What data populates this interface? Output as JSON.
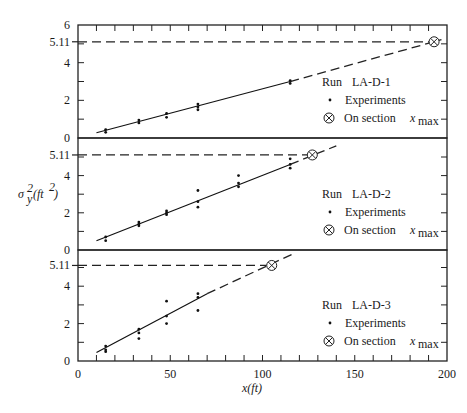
{
  "chart_data": {
    "type": "scatter",
    "title": "",
    "xlabel": "x(ft)",
    "ylabel": "σy²(ft²)",
    "xlim": [
      0,
      200
    ],
    "x_ticks": [
      0,
      50,
      100,
      150,
      200
    ],
    "x_minor_step": 10,
    "reference_value": 5.11,
    "reference_label": "5.11",
    "panels": [
      {
        "run": "LA-D-1",
        "ylim": [
          0,
          6
        ],
        "y_ticks": [
          0,
          2,
          4,
          6
        ],
        "y_minor_step": 1,
        "points": [
          [
            15,
            0.3
          ],
          [
            15,
            0.45
          ],
          [
            33,
            0.8
          ],
          [
            33,
            0.95
          ],
          [
            48,
            1.1
          ],
          [
            48,
            1.3
          ],
          [
            65,
            1.5
          ],
          [
            65,
            1.65
          ],
          [
            65,
            1.8
          ],
          [
            115,
            2.9
          ],
          [
            115,
            3.05
          ]
        ],
        "fit_line": {
          "x_start": 10,
          "x_end": 115,
          "y_start": 0.28,
          "y_end": 3.0
        },
        "extrapolation": {
          "x_start": 115,
          "x_end": 197,
          "y_start": 3.0,
          "y_end": 5.22
        },
        "x_max": 193,
        "x_max_value": 5.11
      },
      {
        "run": "LA-D-2",
        "ylim": [
          0,
          6
        ],
        "y_ticks": [
          0,
          2,
          4
        ],
        "y_minor_step": 1,
        "points": [
          [
            15,
            0.5
          ],
          [
            15,
            0.7
          ],
          [
            33,
            1.3
          ],
          [
            33,
            1.4
          ],
          [
            33,
            1.5
          ],
          [
            48,
            1.9
          ],
          [
            48,
            2.0
          ],
          [
            48,
            2.1
          ],
          [
            65,
            2.3
          ],
          [
            65,
            2.6
          ],
          [
            65,
            3.2
          ],
          [
            87,
            3.4
          ],
          [
            87,
            3.6
          ],
          [
            87,
            4.0
          ],
          [
            115,
            4.4
          ],
          [
            115,
            4.6
          ],
          [
            115,
            4.9
          ]
        ],
        "fit_line": {
          "x_start": 10,
          "x_end": 115,
          "y_start": 0.5,
          "y_end": 4.6
        },
        "extrapolation": {
          "x_start": 115,
          "x_end": 140,
          "y_start": 4.6,
          "y_end": 5.6
        },
        "x_max": 127,
        "x_max_value": 5.11
      },
      {
        "run": "LA-D-3",
        "ylim": [
          0,
          6
        ],
        "y_ticks": [
          0,
          2,
          4
        ],
        "y_minor_step": 1,
        "points": [
          [
            15,
            0.5
          ],
          [
            15,
            0.6
          ],
          [
            15,
            0.8
          ],
          [
            33,
            1.2
          ],
          [
            33,
            1.5
          ],
          [
            33,
            1.7
          ],
          [
            48,
            2.0
          ],
          [
            48,
            2.4
          ],
          [
            48,
            3.2
          ],
          [
            65,
            2.7
          ],
          [
            65,
            3.4
          ],
          [
            65,
            3.6
          ]
        ],
        "fit_line": {
          "x_start": 10,
          "x_end": 70,
          "y_start": 0.45,
          "y_end": 3.6
        },
        "extrapolation": {
          "x_start": 70,
          "x_end": 117,
          "y_start": 3.6,
          "y_end": 5.75
        },
        "x_max": 105,
        "x_max_value": 5.11
      }
    ],
    "legend": {
      "run_label": "Run",
      "experiments_label": "Experiments",
      "section_label": "On section",
      "section_var": "x",
      "section_sub": "max",
      "placement": "right-middle"
    }
  }
}
